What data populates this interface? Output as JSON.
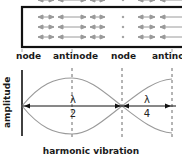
{
  "diagram": {
    "title": "harmonic vibration",
    "y_axis_label": "amplitude",
    "position_labels": [
      "node",
      "antinode",
      "node",
      "antino"
    ],
    "fractions": [
      {
        "numerator": "λ",
        "denominator": "2"
      },
      {
        "numerator": "λ",
        "denominator": "4"
      }
    ],
    "tube": {
      "description": "air column with particle displacement arrows",
      "arrow_rows": 3
    },
    "colors": {
      "tube_border": "#111111",
      "arrows": "#9a9a9a",
      "wave": "#9a9a9a",
      "axis": "#111111",
      "dashed": "#444444"
    }
  }
}
